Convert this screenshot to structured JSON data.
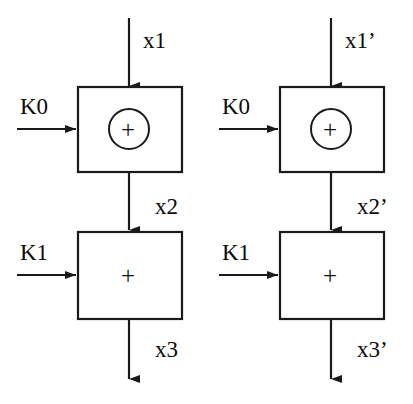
{
  "diagram": {
    "type": "block-diagram",
    "background_color": "#ffffff",
    "line_color": "#1a1a1a",
    "text_color": "#0b0b0b",
    "columns": [
      {
        "id": "left",
        "input_label": "x1",
        "stage1": {
          "key_label": "K0",
          "operator": "+",
          "operator_style": "circled-plus",
          "operator_glyph": "+",
          "output_label": "x2"
        },
        "stage2": {
          "key_label": "K1",
          "operator": "+",
          "operator_style": "plain-plus",
          "operator_glyph": "+",
          "output_label": "x3"
        }
      },
      {
        "id": "right",
        "input_label": "x1’",
        "stage1": {
          "key_label": "K0",
          "operator": "+",
          "operator_style": "circled-plus",
          "operator_glyph": "+",
          "output_label": "x2’"
        },
        "stage2": {
          "key_label": "K1",
          "operator": "+",
          "operator_style": "plain-plus",
          "operator_glyph": "+",
          "output_label": "x3’"
        }
      }
    ]
  }
}
